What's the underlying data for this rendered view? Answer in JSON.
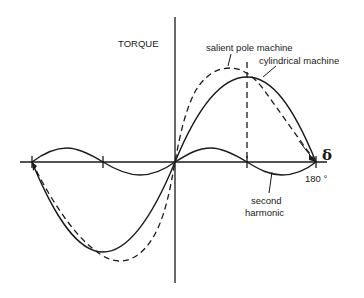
{
  "diagram": {
    "y_axis_label": "TORQUE",
    "x_axis_symbol": "δ",
    "x_end_label": "180 °",
    "annotations": {
      "salient": "salient pole machine",
      "cylindrical": "cylindrical machine",
      "second_harmonic_line1": "second",
      "second_harmonic_line2": "harmonic"
    },
    "curves": [
      {
        "name": "cylindrical machine",
        "style": "solid",
        "shape": "sin(δ)"
      },
      {
        "name": "salient pole machine",
        "style": "dashed",
        "shape": "sin(δ) + k·sin(2δ)"
      },
      {
        "name": "second harmonic",
        "style": "solid",
        "shape": "k·sin(2δ)"
      }
    ],
    "x_ticks": [
      "-180°",
      "-90°",
      "0°",
      "90°",
      "180°"
    ]
  }
}
